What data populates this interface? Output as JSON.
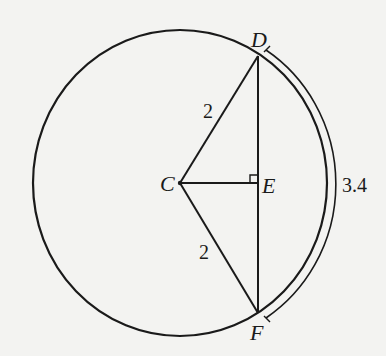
{
  "diagram": {
    "type": "circle-geometry",
    "circle": {
      "center_label": "C"
    },
    "points": {
      "C": "C",
      "D": "D",
      "E": "E",
      "F": "F"
    },
    "segments": [
      {
        "from": "C",
        "to": "D",
        "label": "2"
      },
      {
        "from": "C",
        "to": "F",
        "label": "2"
      },
      {
        "from": "C",
        "to": "E",
        "label": ""
      },
      {
        "from": "D",
        "to": "F",
        "label": ""
      }
    ],
    "right_angle_at": "E",
    "arc": {
      "from": "D",
      "to": "F",
      "label": "3.4"
    }
  },
  "colors": {
    "background": "#f3f3f1",
    "stroke": "#1a1a1a"
  }
}
